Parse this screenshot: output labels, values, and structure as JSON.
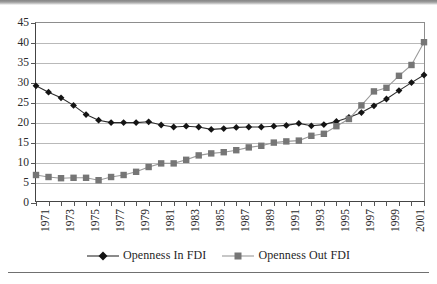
{
  "chart_data": {
    "type": "line",
    "title": "",
    "subtitle": "",
    "xlabel": "",
    "ylabel": "",
    "ylim": [
      0,
      45
    ],
    "ytick_step": 5,
    "ytick_labels": [
      "0",
      "5",
      "10",
      "15",
      "20",
      "25",
      "30",
      "35",
      "40",
      "45"
    ],
    "grid": true,
    "legend_position": "bottom",
    "x": [
      1971,
      1972,
      1973,
      1974,
      1975,
      1976,
      1977,
      1978,
      1979,
      1980,
      1981,
      1982,
      1983,
      1984,
      1985,
      1986,
      1987,
      1988,
      1989,
      1990,
      1991,
      1992,
      1993,
      1994,
      1995,
      1996,
      1997,
      1998,
      1999,
      2000,
      2001,
      2002
    ],
    "xtick_labels": [
      "1971",
      "1973",
      "1975",
      "1977",
      "1979",
      "1981",
      "1983",
      "1985",
      "1987",
      "1989",
      "1991",
      "1993",
      "1995",
      "1997",
      "1999",
      "2001"
    ],
    "xtick_labeled_years": [
      1971,
      1973,
      1975,
      1977,
      1979,
      1981,
      1983,
      1985,
      1987,
      1989,
      1991,
      1993,
      1995,
      1997,
      1999,
      2001
    ],
    "series": [
      {
        "name": "Openness In FDI",
        "marker": "diamond",
        "color": "#141414",
        "line_color": "#2c2c2c",
        "values": [
          29.3,
          27.7,
          26.3,
          24.4,
          22.1,
          20.7,
          20.1,
          20.1,
          20.1,
          20.3,
          19.5,
          19.0,
          19.2,
          19.0,
          18.4,
          18.6,
          18.9,
          19.0,
          19.0,
          19.2,
          19.4,
          19.9,
          19.3,
          19.6,
          20.4,
          21.4,
          22.6,
          24.3,
          26.0,
          28.1,
          30.1,
          32.0
        ]
      },
      {
        "name": "Openness Out FDI",
        "marker": "square",
        "color": "#767676",
        "line_color": "#9a9a9a",
        "values": [
          7.0,
          6.5,
          6.2,
          6.3,
          6.3,
          5.7,
          6.5,
          7.0,
          7.8,
          9.0,
          9.9,
          9.9,
          10.8,
          11.9,
          12.4,
          12.7,
          13.2,
          13.9,
          14.3,
          15.1,
          15.4,
          15.6,
          16.8,
          17.3,
          19.2,
          21.0,
          24.4,
          27.9,
          28.8,
          31.8,
          34.5,
          40.2
        ]
      }
    ]
  },
  "legend": {
    "entries": [
      {
        "label": "Openness In FDI",
        "marker": "diamond-marker-icon"
      },
      {
        "label": "Openness Out FDI",
        "marker": "square-marker-icon"
      }
    ]
  },
  "colors": {
    "series_in": "#141414",
    "series_out": "#767676",
    "gridline": "#b9b9b9",
    "axis": "#444444"
  }
}
